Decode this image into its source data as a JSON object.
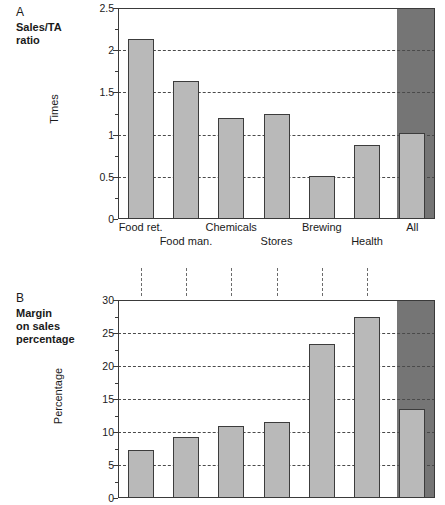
{
  "figure": {
    "panels": [
      {
        "letter": "A",
        "title": "Sales/TA\nratio",
        "title_line1": "Sales/TA",
        "title_line2": "ratio"
      },
      {
        "letter": "B",
        "title_line1": "Margin",
        "title_line2": "on sales",
        "title_line3": "percentage"
      }
    ]
  },
  "chart_data": [
    {
      "type": "bar",
      "panel": "A",
      "title": "Sales/TA ratio",
      "xlabel": "",
      "ylabel": "Times",
      "ylim": [
        0,
        2.5
      ],
      "yticks": [
        0,
        0.5,
        1,
        1.5,
        2,
        2.5
      ],
      "ytick_labels": [
        "0",
        "0.5",
        "1",
        "1.5",
        "2",
        "2.5"
      ],
      "minor_ytick_step": 0.25,
      "grid": true,
      "legend": "none",
      "categories": [
        "Food ret.",
        "Food man.",
        "Chemicals",
        "Stores",
        "Brewing",
        "Health",
        "All"
      ],
      "values": [
        2.13,
        1.64,
        1.2,
        1.25,
        0.51,
        0.88,
        1.02
      ],
      "highlight_category": "All"
    },
    {
      "type": "bar",
      "panel": "B",
      "title": "Margin on sales percentage",
      "xlabel": "",
      "ylabel": "Percentage",
      "ylim": [
        0,
        30
      ],
      "yticks": [
        0,
        5,
        10,
        15,
        20,
        25,
        30
      ],
      "ytick_labels": [
        "0",
        "5",
        "10",
        "15",
        "20",
        "25",
        "30"
      ],
      "minor_ytick_step": 2.5,
      "grid": true,
      "legend": "none",
      "categories": [
        "Food ret.",
        "Food man.",
        "Chemicals",
        "Stores",
        "Brewing",
        "Health",
        "All"
      ],
      "values": [
        7.2,
        9.3,
        10.9,
        11.5,
        23.3,
        27.4,
        13.5
      ],
      "highlight_category": "All"
    }
  ],
  "colors": {
    "bar_fill": "#b9b9b9",
    "bar_border": "#3c3c3c",
    "highlight_band": "#757575",
    "grid": "#4a4a4a",
    "frame": "#3a3a3a",
    "text": "#1a1a1a",
    "background": "#ffffff"
  },
  "xaxis_labels": {
    "row1": [
      "Food ret.",
      "Chemicals",
      "Brewing",
      "All"
    ],
    "row2": [
      "Food man.",
      "Stores",
      "Health"
    ]
  }
}
